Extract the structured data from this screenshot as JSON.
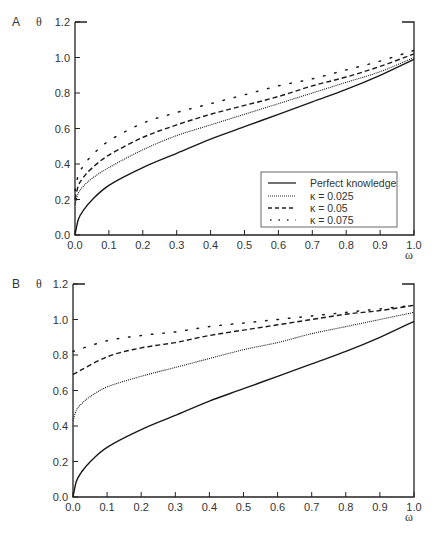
{
  "figure": {
    "panels": [
      {
        "label": "A",
        "ylabel": "θ",
        "xlabel": "ω"
      },
      {
        "label": "B",
        "ylabel": "θ",
        "xlabel": "ω"
      }
    ],
    "legend": [
      {
        "name": "Perfect knowledge",
        "style": "solid"
      },
      {
        "name": "κ  = 0.025",
        "style": "dotted"
      },
      {
        "name": "κ  = 0.05",
        "style": "dashed"
      },
      {
        "name": "κ  = 0.075",
        "style": "sparse-dots"
      }
    ],
    "x_ticks": [
      "0.0",
      "0.1",
      "0.2",
      "0.3",
      "0.4",
      "0.5",
      "0.6",
      "0.7",
      "0.8",
      "0.9",
      "1.0"
    ],
    "y_ticks": [
      "0.0",
      "0.2",
      "0.4",
      "0.6",
      "0.8",
      "1.0",
      "1.2"
    ]
  },
  "chart_data": [
    {
      "type": "line",
      "title": "A",
      "xlabel": "ω",
      "ylabel": "θ",
      "xlim": [
        0,
        1.0
      ],
      "ylim": [
        0,
        1.2
      ],
      "grid": false,
      "legend_position": "lower right",
      "x": [
        0.0,
        0.1,
        0.2,
        0.3,
        0.4,
        0.5,
        0.6,
        0.7,
        0.8,
        0.9,
        1.0
      ],
      "series": [
        {
          "name": "Perfect knowledge",
          "style": "solid",
          "values": [
            0.0,
            0.28,
            0.38,
            0.46,
            0.54,
            0.61,
            0.68,
            0.75,
            0.82,
            0.9,
            0.99
          ]
        },
        {
          "name": "κ = 0.025",
          "style": "dotted",
          "values": [
            0.17,
            0.38,
            0.48,
            0.56,
            0.62,
            0.68,
            0.74,
            0.8,
            0.86,
            0.92,
            1.0
          ]
        },
        {
          "name": "κ = 0.05",
          "style": "dashed",
          "values": [
            0.2,
            0.45,
            0.55,
            0.62,
            0.68,
            0.73,
            0.78,
            0.84,
            0.89,
            0.95,
            1.02
          ]
        },
        {
          "name": "κ = 0.075",
          "style": "sparse-dots",
          "values": [
            0.25,
            0.53,
            0.63,
            0.69,
            0.74,
            0.79,
            0.84,
            0.88,
            0.93,
            0.98,
            1.04
          ]
        }
      ]
    },
    {
      "type": "line",
      "title": "B",
      "xlabel": "ω",
      "ylabel": "θ",
      "xlim": [
        0,
        1.0
      ],
      "ylim": [
        0,
        1.2
      ],
      "grid": false,
      "x": [
        0.0,
        0.1,
        0.2,
        0.3,
        0.4,
        0.5,
        0.6,
        0.7,
        0.8,
        0.9,
        1.0
      ],
      "series": [
        {
          "name": "Perfect knowledge",
          "style": "solid",
          "values": [
            0.0,
            0.28,
            0.38,
            0.46,
            0.54,
            0.61,
            0.68,
            0.75,
            0.82,
            0.9,
            0.99
          ]
        },
        {
          "name": "κ = 0.025",
          "style": "dotted",
          "values": [
            0.43,
            0.62,
            0.68,
            0.73,
            0.78,
            0.83,
            0.87,
            0.92,
            0.96,
            1.0,
            1.04
          ]
        },
        {
          "name": "κ = 0.05",
          "style": "dashed",
          "values": [
            0.69,
            0.79,
            0.84,
            0.87,
            0.91,
            0.94,
            0.97,
            1.0,
            1.03,
            1.05,
            1.08
          ]
        },
        {
          "name": "κ = 0.075",
          "style": "sparse-dots",
          "values": [
            0.82,
            0.88,
            0.91,
            0.93,
            0.96,
            0.98,
            1.0,
            1.02,
            1.04,
            1.06,
            1.08
          ]
        }
      ]
    }
  ]
}
